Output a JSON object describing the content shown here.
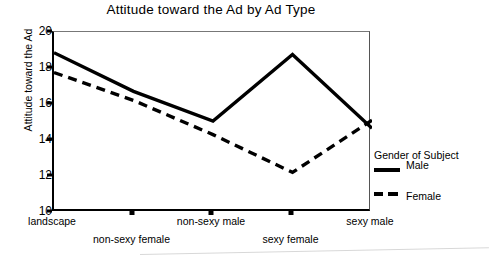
{
  "chart_data": {
    "type": "line",
    "title": "Attitude toward the Ad by Ad Type",
    "xlabel": "",
    "ylabel": "Attitude toward the Ad",
    "ylim": [
      10,
      20
    ],
    "yticks": [
      20,
      18,
      16,
      14,
      12,
      10
    ],
    "grid": false,
    "legend_position": "right",
    "legend_title": "Gender of Subject",
    "categories": [
      "landscape",
      "non-sexy female",
      "non-sexy male",
      "sexy female",
      "sexy male"
    ],
    "series": [
      {
        "name": "Male",
        "style": "solid",
        "values": [
          18.85,
          16.7,
          15.05,
          18.75,
          14.65
        ]
      },
      {
        "name": "Female",
        "style": "dashed",
        "values": [
          17.75,
          16.2,
          14.3,
          12.2,
          15.1
        ]
      }
    ]
  },
  "title": "Attitude toward the Ad by Ad Type",
  "axes": {
    "y_title": "Attitude toward the Ad",
    "y_ticks": [
      "20",
      "18",
      "16",
      "14",
      "12",
      "10"
    ],
    "x_labels": [
      "landscape",
      "non-sexy female",
      "non-sexy male",
      "sexy female",
      "sexy male"
    ]
  },
  "legend": {
    "title": "Gender of Subject",
    "entries": [
      {
        "label": "Male",
        "style": "solid"
      },
      {
        "label": "Female",
        "style": "dashed"
      }
    ]
  },
  "colors": {
    "line": "#000000",
    "frame": "#000000",
    "background": "#ffffff"
  }
}
